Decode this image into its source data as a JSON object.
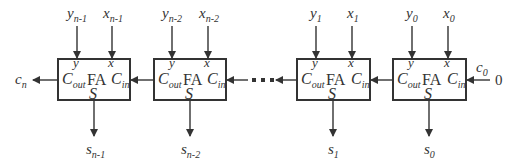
{
  "diagram": {
    "line_color": "#333333",
    "cells": [
      {
        "id": "fa-n-1",
        "name": "FA",
        "inputs": {
          "y": {
            "var": "y",
            "sub": "n-1"
          },
          "x": {
            "var": "x",
            "sub": "n-1"
          }
        },
        "ports": {
          "y": "y",
          "x": "x",
          "cout_main": "C",
          "cout_sub": "out",
          "cin_main": "C",
          "cin_sub": "in",
          "s": "S"
        },
        "output": {
          "var": "s",
          "sub": "n-1"
        }
      },
      {
        "id": "fa-n-2",
        "name": "FA",
        "inputs": {
          "y": {
            "var": "y",
            "sub": "n-2"
          },
          "x": {
            "var": "x",
            "sub": "n-2"
          }
        },
        "ports": {
          "y": "y",
          "x": "x",
          "cout_main": "C",
          "cout_sub": "out",
          "cin_main": "C",
          "cin_sub": "in",
          "s": "S"
        },
        "output": {
          "var": "s",
          "sub": "n-2"
        }
      },
      {
        "id": "fa-1",
        "name": "FA",
        "inputs": {
          "y": {
            "var": "y",
            "sub": "1"
          },
          "x": {
            "var": "x",
            "sub": "1"
          }
        },
        "ports": {
          "y": "y",
          "x": "x",
          "cout_main": "C",
          "cout_sub": "out",
          "cin_main": "C",
          "cin_sub": "in",
          "s": "S"
        },
        "output": {
          "var": "s",
          "sub": "1"
        }
      },
      {
        "id": "fa-0",
        "name": "FA",
        "inputs": {
          "y": {
            "var": "y",
            "sub": "0"
          },
          "x": {
            "var": "x",
            "sub": "0"
          }
        },
        "ports": {
          "y": "y",
          "x": "x",
          "cout_main": "C",
          "cout_sub": "out",
          "cin_main": "C",
          "cin_sub": "in",
          "s": "S"
        },
        "output": {
          "var": "s",
          "sub": "0"
        }
      }
    ],
    "carry_out": {
      "var": "c",
      "sub": "n"
    },
    "carry_in": {
      "var": "c",
      "sub": "0",
      "value": "0"
    },
    "ellipsis": "• • •"
  }
}
